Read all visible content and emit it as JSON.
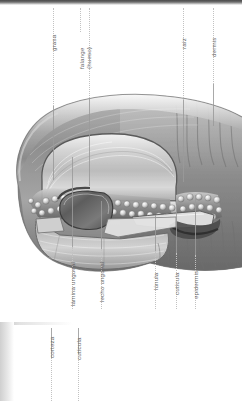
{
  "document": {
    "language": "es",
    "title": "Anatomía de la uña",
    "orientation": "rotated-90-ccw",
    "style": "grayscale medical illustration, cross-section"
  },
  "figure": {
    "name": "nail-cross-section"
  },
  "labels": {
    "top": [
      {
        "id": "grasa",
        "text": "grasa",
        "line_x": 53,
        "line_top": 8,
        "line_bottom": 178
      },
      {
        "id": "falange",
        "text": "falange\n(hueso)",
        "text_line1": "falange",
        "text_line2": "(hueso)",
        "line_x": 89,
        "line_top": 8,
        "line_bottom": 180
      },
      {
        "id": "raiz",
        "text": "raíz",
        "line_x": 183,
        "line_top": 8,
        "line_bottom": 175
      },
      {
        "id": "dermis",
        "text": "dermis",
        "line_x": 213,
        "line_top": 8,
        "line_bottom": 120
      }
    ],
    "bottom": [
      {
        "id": "lamina-ungueal",
        "text": "lámina ungueal",
        "line_x": 72,
        "line_top": 160,
        "line_bottom": 300
      },
      {
        "id": "lecho-ungueal",
        "text": "lecho ungueal",
        "line_x": 101,
        "line_top": 200,
        "line_bottom": 300
      },
      {
        "id": "lunula",
        "text": "lúnula",
        "line_x": 155,
        "line_top": 215,
        "line_bottom": 300
      },
      {
        "id": "cuticula",
        "text": "cutícula",
        "line_x": 176,
        "line_top": 205,
        "line_bottom": 300
      },
      {
        "id": "epidermis",
        "text": "epidermis",
        "line_x": 195,
        "line_top": 195,
        "line_bottom": 300
      }
    ],
    "second_panel": [
      {
        "id": "corteza",
        "text": "corteza",
        "line_x": 51,
        "line_top": 6,
        "line_bottom": 79
      },
      {
        "id": "cuticula-2",
        "text": "cutícula",
        "line_x": 78,
        "line_top": 6,
        "line_bottom": 79
      }
    ]
  },
  "colors": {
    "background": "#ffffff",
    "label_text": "#6a6a6a",
    "leader_line": "#b4b4b4",
    "band_dark": "#4a4a4a",
    "illustration_light": "#e6e6e6",
    "illustration_mid": "#9c9c9c",
    "illustration_dark": "#4e4e4e"
  }
}
